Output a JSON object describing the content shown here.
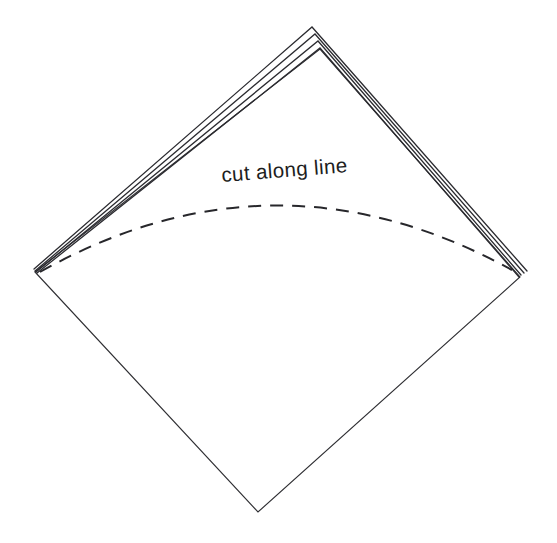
{
  "figure": {
    "background_color": "#ffffff",
    "line_color": "#2b2b30",
    "dash_color": "#27272b",
    "label": "cut  along  line",
    "label_text_color": "#1d1d21",
    "label_font_size": "20.5",
    "label_x": "222",
    "label_y": "182",
    "label_rotation": "-4.5",
    "sheet": {
      "name": "folded-square-sheet",
      "orientation": "diamond",
      "top_vertex_x": "320",
      "top_vertex_y": "49",
      "left_vertex_x": "35",
      "left_vertex_y": "272",
      "right_vertex_x": "520",
      "right_vertex_y": "277",
      "bottom_vertex_x": "258",
      "bottom_vertex_y": "512",
      "outline_path": "M 35 272 L 320 49 L 520 277 L 258 512 Z"
    },
    "fold_layers": [
      {
        "name": "fold-layer-1-outermost",
        "apex_x": "312",
        "apex_y": "27",
        "path": "M 34 269 L 312 27 L 527 271"
      },
      {
        "name": "fold-layer-2",
        "apex_x": "315",
        "apex_y": "34",
        "path": "M 35 271 L 315 34 L 524 273"
      },
      {
        "name": "fold-layer-3",
        "apex_x": "318",
        "apex_y": "41",
        "path": "M 36 272 L 318 41 L 521 275"
      },
      {
        "name": "fold-layer-4-innermost",
        "apex_x": "320",
        "apex_y": "48",
        "path": "M 37 273 L 320 48 L 519 277"
      }
    ],
    "cut_arc": {
      "name": "cut-along-line-arc",
      "style": "dashed",
      "dash_pattern": "13 9",
      "start_x": "40",
      "start_y": "272",
      "end_x": "512",
      "end_y": "270",
      "apex_x": "272",
      "apex_y": "197",
      "path": "M 40 272 Q 275 140 512 270"
    }
  }
}
